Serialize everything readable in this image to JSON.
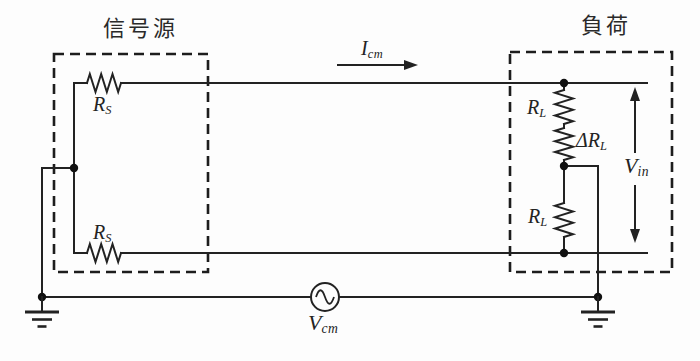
{
  "figure": {
    "type": "common-mode-interference-circuit-diagram",
    "background_color": "#fdfdfd",
    "line_color": "#222222",
    "signal_source_box": {
      "label": "信号源"
    },
    "load_box": {
      "label": "負荷"
    },
    "labels": {
      "rs_top": {
        "main": "R",
        "sub": "S"
      },
      "rs_bottom": {
        "main": "R",
        "sub": "S"
      },
      "icm": {
        "main": "I",
        "sub": "cm"
      },
      "rl_top": {
        "main": "R",
        "sub": "L"
      },
      "delta_rl": {
        "main": "ΔR",
        "sub": "L"
      },
      "rl_bottom": {
        "main": "R",
        "sub": "L"
      },
      "vin": {
        "main": "V",
        "sub": "in"
      },
      "vcm": {
        "main": "V",
        "sub": "cm"
      }
    }
  }
}
